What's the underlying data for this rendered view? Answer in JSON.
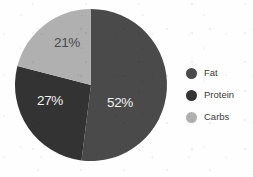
{
  "chart_data": {
    "type": "pie",
    "title": "",
    "categories": [
      "Fat",
      "Protein",
      "Carbs"
    ],
    "values": [
      52,
      27,
      21
    ],
    "value_unit": "%",
    "data_labels": [
      "52%",
      "27%",
      "21%"
    ],
    "colors": [
      "#4a4a4a",
      "#333333",
      "#b0b0b0"
    ],
    "label_text_colors": [
      "#f2f2f2",
      "#f2f2f2",
      "#4a4a4a"
    ],
    "start_angle_deg": 0,
    "direction": "clockwise",
    "legend": {
      "position": "right",
      "entries": [
        {
          "label": "Fat",
          "color": "#4a4a4a",
          "swatch": "circle-swatch"
        },
        {
          "label": "Protein",
          "color": "#333333",
          "swatch": "circle-swatch"
        },
        {
          "label": "Carbs",
          "color": "#b0b0b0",
          "swatch": "circle-swatch"
        }
      ]
    },
    "grid": false,
    "xlabel": "",
    "ylabel": "",
    "background": "#fefefe"
  },
  "geometry": {
    "center_x": 91,
    "center_y": 85,
    "radius": 76,
    "label_positions": [
      {
        "x": 120,
        "y": 107
      },
      {
        "x": 50,
        "y": 105
      },
      {
        "x": 67,
        "y": 47
      }
    ]
  }
}
